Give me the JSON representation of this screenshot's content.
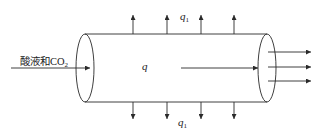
{
  "diagram": {
    "inlet_label": "酸液和CO",
    "inlet_sub": "2",
    "flow_label": "q",
    "leak_label_top": "q",
    "leak_label_top_sub": "1",
    "leak_label_bottom": "q",
    "leak_label_bottom_sub": "1",
    "stroke_color": "#2a2a2a",
    "leak_arrow_x": [
      133,
      167,
      201,
      234
    ],
    "outlet_arrow_y": [
      52,
      67,
      81
    ]
  }
}
